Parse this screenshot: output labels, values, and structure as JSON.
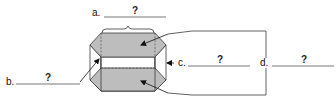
{
  "diagram": {
    "colors": {
      "face_fill": "#bdbdbd",
      "line": "#3a3a3a",
      "answer_line": "#555555"
    },
    "labels": [
      {
        "id": "a",
        "letter": "a.",
        "answer": "?",
        "points_to": "top face width (brace)"
      },
      {
        "id": "b",
        "letter": "b.",
        "answer": "?",
        "points_to": "lateral edge"
      },
      {
        "id": "c",
        "letter": "c.",
        "answer": "?",
        "points_to": "lateral face"
      },
      {
        "id": "d",
        "letter": "d.",
        "answer": "?",
        "points_to": "both shaded bases"
      }
    ]
  }
}
